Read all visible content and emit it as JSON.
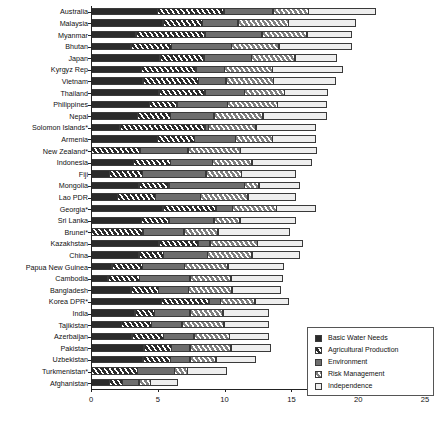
{
  "chart_data": {
    "type": "bar",
    "orientation": "horizontal",
    "stacked": true,
    "title": "",
    "subtitle": "",
    "xlabel": "",
    "ylabel": "",
    "xlim": [
      0,
      25
    ],
    "xticks": [
      0,
      5,
      10,
      15,
      20,
      25
    ],
    "xticklabels": [
      "0",
      "5",
      "10",
      "15",
      "20",
      "25"
    ],
    "grid": false,
    "legend_position": "bottom-right",
    "legend": [
      {
        "label": "Basic Water Needs",
        "key": "basic",
        "pattern": "solid-dark",
        "color": "#2b2b2b"
      },
      {
        "label": "Agricultural Production",
        "key": "agri",
        "pattern": "dark-hatched",
        "color": "#2b2b2b"
      },
      {
        "label": "Environment",
        "key": "env",
        "pattern": "solid-gray",
        "color": "#6e6e6e"
      },
      {
        "label": "Risk Management",
        "key": "risk",
        "pattern": "light-hatched",
        "color": "#d8d8d8"
      },
      {
        "label": "Independence",
        "key": "indep",
        "pattern": "solid-white",
        "color": "#eeeeee"
      }
    ],
    "categories": [
      "Australia",
      "Malaysia",
      "Myanmar",
      "Bhutan",
      "Japan",
      "Kyrgyz Rep",
      "Vietnam",
      "Thailand",
      "Philippines",
      "Nepal",
      "Solomon Islands*",
      "Armenia",
      "New Zealand*",
      "Indonesia",
      "Fiji",
      "Mongolia",
      "Lao PDR",
      "Georgia*",
      "Sri Lanka",
      "Brunei*",
      "Kazakhstan",
      "China",
      "Papua New Guinea",
      "Cambodia",
      "Bangladesh",
      "Korea DPR*",
      "India",
      "Tajikistan",
      "Azerbaijan",
      "Pakistan",
      "Uzbekistan",
      "Turkmenistan*",
      "Afghanistan"
    ],
    "series": [
      {
        "name": "Basic Water Needs",
        "values": [
          5.0,
          5.4,
          3.4,
          3.0,
          5.2,
          3.8,
          3.9,
          5.1,
          4.4,
          3.5,
          2.2,
          5.0,
          0.0,
          3.2,
          1.4,
          3.6,
          2.0,
          5.4,
          3.8,
          0.0,
          5.1,
          3.6,
          1.6,
          1.3,
          3.0,
          5.3,
          3.3,
          2.3,
          3.1,
          4.0,
          3.9,
          0.0,
          1.4
        ]
      },
      {
        "name": "Agricultural Production",
        "values": [
          5.0,
          3.0,
          5.2,
          3.1,
          3.3,
          4.1,
          4.2,
          3.5,
          2.1,
          2.5,
          6.4,
          2.8,
          3.7,
          2.8,
          2.5,
          2.3,
          2.9,
          4.0,
          2.1,
          3.9,
          3.0,
          1.9,
          2.3,
          2.4,
          2.1,
          3.6,
          1.5,
          2.3,
          2.4,
          2.1,
          2.1,
          3.5,
          1.0
        ]
      },
      {
        "name": "Environment",
        "values": [
          3.7,
          2.7,
          4.3,
          4.5,
          3.6,
          2.2,
          2.1,
          3.0,
          3.8,
          3.3,
          0.3,
          3.1,
          3.6,
          3.2,
          4.8,
          5.7,
          3.4,
          1.3,
          3.4,
          3.1,
          0.9,
          3.3,
          3.2,
          3.8,
          2.3,
          0.9,
          2.7,
          2.3,
          2.3,
          1.4,
          1.5,
          2.8,
          1.3
        ]
      },
      {
        "name": "Risk Management",
        "values": [
          2.7,
          3.8,
          3.4,
          3.6,
          3.3,
          3.6,
          3.6,
          3.0,
          3.8,
          3.7,
          3.6,
          2.8,
          4.0,
          3.0,
          2.7,
          1.1,
          3.6,
          3.3,
          2.0,
          2.6,
          3.6,
          3.4,
          3.3,
          3.1,
          3.3,
          2.6,
          2.5,
          3.2,
          2.7,
          3.1,
          2.0,
          1.0,
          0.9
        ]
      },
      {
        "name": "Independence",
        "values": [
          5.1,
          5.1,
          3.4,
          5.5,
          3.2,
          5.3,
          4.7,
          3.3,
          3.7,
          4.8,
          4.5,
          3.3,
          5.7,
          4.5,
          4.1,
          3.1,
          3.6,
          3.0,
          4.2,
          5.4,
          3.4,
          3.6,
          4.2,
          3.9,
          3.7,
          2.6,
          3.5,
          3.4,
          3.0,
          3.0,
          3.0,
          3.0,
          2.1
        ]
      }
    ],
    "totals": [
      21.5,
      20.0,
      19.7,
      19.7,
      18.6,
      19.0,
      18.5,
      17.9,
      17.8,
      17.8,
      17.0,
      17.0,
      17.0,
      16.7,
      15.5,
      15.8,
      15.5,
      17.0,
      15.5,
      15.0,
      16.0,
      15.8,
      14.6,
      14.5,
      14.4,
      15.0,
      13.5,
      13.5,
      13.5,
      13.6,
      12.5,
      10.3,
      6.7
    ]
  }
}
